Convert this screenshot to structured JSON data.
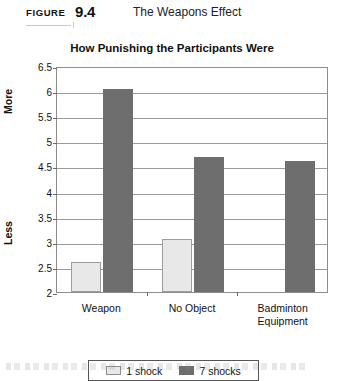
{
  "figure": {
    "label": "FIGURE",
    "number": "9.4",
    "title": "The Weapons Effect"
  },
  "chart_data": {
    "type": "bar",
    "title": "How Punishing the Participants Were",
    "xlabel": "",
    "ylabel": "",
    "categories": [
      "Weapon",
      "No Object",
      "Badminton Equipment"
    ],
    "category_lines": [
      [
        "Weapon"
      ],
      [
        "No Object"
      ],
      [
        "Badminton",
        "Equipment"
      ]
    ],
    "series": [
      {
        "name": "1 shock",
        "color": "#e8e8e8",
        "values": [
          2.6,
          3.05,
          2.0
        ]
      },
      {
        "name": "7 shocks",
        "color": "#6e6e6e",
        "values": [
          6.05,
          4.68,
          4.6
        ]
      }
    ],
    "ylim": [
      2,
      6.5
    ],
    "ytick_step": 0.5,
    "yticks": [
      "6.5",
      "6",
      "5.5",
      "5",
      "4.5",
      "4",
      "3.5",
      "3",
      "2.5",
      "2"
    ],
    "ytick_values": [
      6.5,
      6,
      5.5,
      5,
      4.5,
      4,
      3.5,
      3,
      2.5,
      2
    ],
    "axis_high_label": "More",
    "axis_low_label": "Less",
    "grid": true,
    "legend_position": "bottom"
  }
}
